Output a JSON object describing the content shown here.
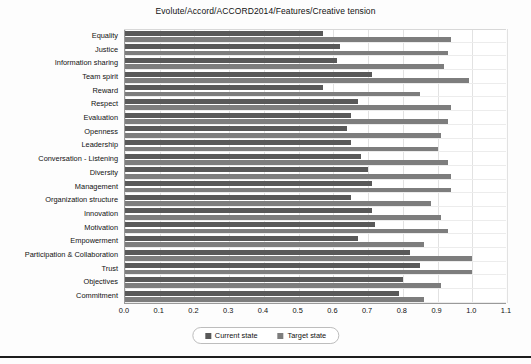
{
  "chart_data": {
    "type": "bar",
    "orientation": "horizontal",
    "title": "Evolute/Accord/ACCORD2014/Features/Creative tension",
    "xlabel": "",
    "ylabel": "",
    "xlim": [
      0.0,
      1.1
    ],
    "xticks": [
      "0.0",
      "0.1",
      "0.2",
      "0.3",
      "0.4",
      "0.5",
      "0.6",
      "0.7",
      "0.8",
      "0.9",
      "1.0",
      "1.1"
    ],
    "grid": true,
    "legend_position": "bottom",
    "categories": [
      "Equality",
      "Justice",
      "Information sharing",
      "Team spirit",
      "Reward",
      "Respect",
      "Evaluation",
      "Openness",
      "Leadership",
      "Conversation - Listening",
      "Diversity",
      "Management",
      "Organization structure",
      "Innovation",
      "Motivation",
      "Empowerment",
      "Participation & Collaboration",
      "Trust",
      "Objectives",
      "Commitment"
    ],
    "series": [
      {
        "name": "Current state",
        "color": "#595959",
        "values": [
          0.57,
          0.62,
          0.61,
          0.71,
          0.57,
          0.67,
          0.65,
          0.64,
          0.65,
          0.68,
          0.7,
          0.71,
          0.65,
          0.71,
          0.72,
          0.67,
          0.82,
          0.85,
          0.8,
          0.79
        ]
      },
      {
        "name": "Target state",
        "color": "#7d7d7d",
        "values": [
          0.94,
          0.93,
          0.92,
          0.99,
          0.85,
          0.94,
          0.93,
          0.91,
          0.9,
          0.93,
          0.94,
          0.94,
          0.88,
          0.91,
          0.93,
          0.86,
          1.0,
          1.0,
          0.91,
          0.86
        ]
      }
    ]
  },
  "legend": {
    "items": [
      {
        "label": "Current state",
        "color": "#595959"
      },
      {
        "label": "Target state",
        "color": "#7d7d7d"
      }
    ]
  }
}
